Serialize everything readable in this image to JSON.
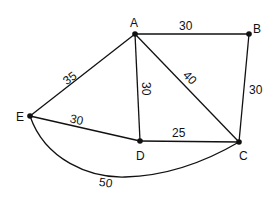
{
  "diagram": {
    "type": "weighted-graph",
    "nodes": [
      {
        "id": "A",
        "label": "A"
      },
      {
        "id": "B",
        "label": "B"
      },
      {
        "id": "C",
        "label": "C"
      },
      {
        "id": "D",
        "label": "D"
      },
      {
        "id": "E",
        "label": "E"
      }
    ],
    "edges": [
      {
        "from": "A",
        "to": "B",
        "weight": "30"
      },
      {
        "from": "A",
        "to": "E",
        "weight": "35"
      },
      {
        "from": "A",
        "to": "D",
        "weight": "30"
      },
      {
        "from": "A",
        "to": "C",
        "weight": "40"
      },
      {
        "from": "B",
        "to": "C",
        "weight": "30"
      },
      {
        "from": "E",
        "to": "D",
        "weight": "30"
      },
      {
        "from": "D",
        "to": "C",
        "weight": "25"
      },
      {
        "from": "E",
        "to": "C",
        "weight": "50"
      }
    ]
  }
}
